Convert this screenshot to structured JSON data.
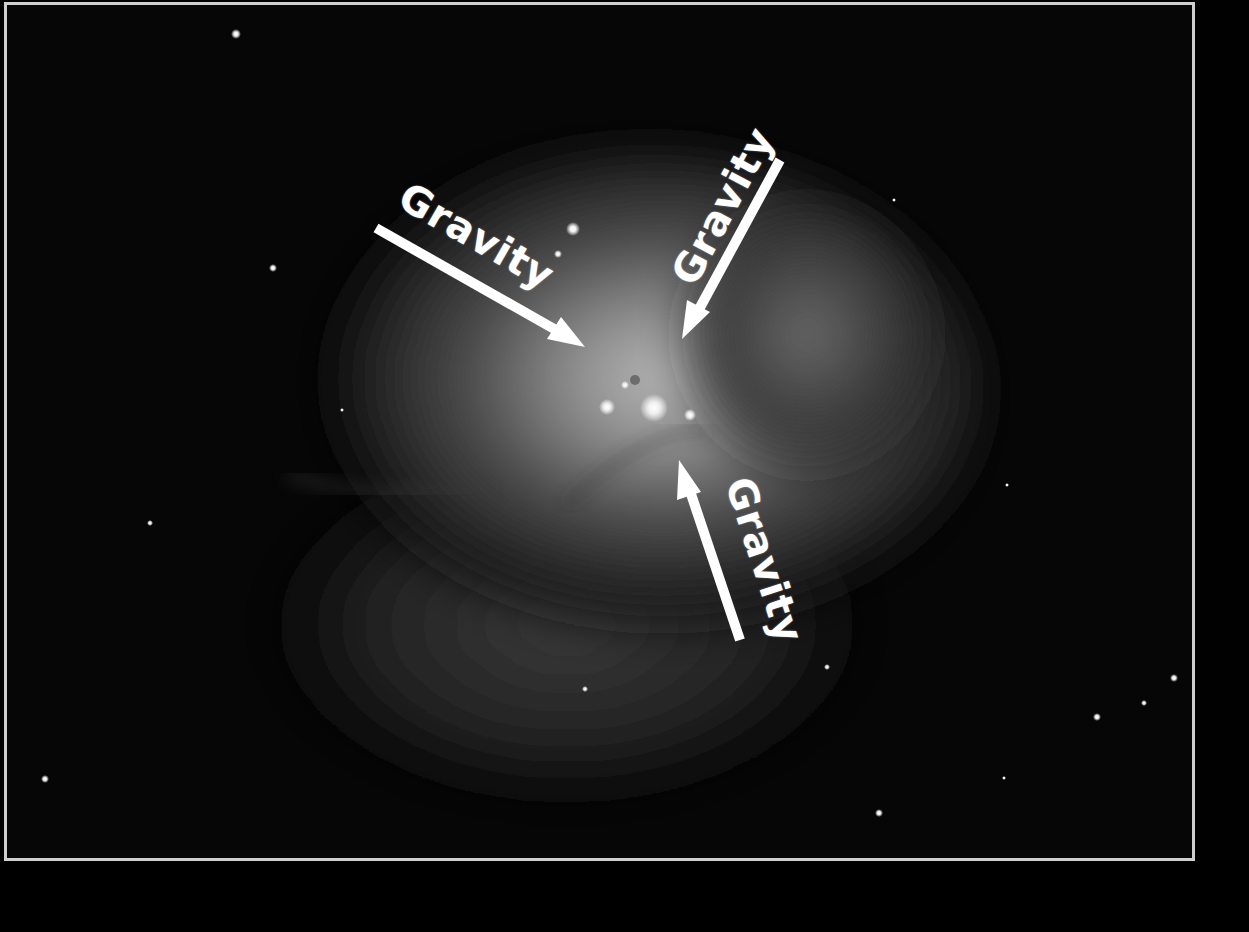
{
  "image": {
    "subject": "Star-forming nebula with central bright stars",
    "background_color": "#050505",
    "frame_color": "#cfcfcf",
    "nebula_color": "#9a9a9a"
  },
  "annotations": [
    {
      "label": "Gravity",
      "arrow_from": [
        376,
        228
      ],
      "arrow_to": [
        583,
        345
      ],
      "direction": "down-right"
    },
    {
      "label": "Gravity",
      "arrow_from": [
        780,
        160
      ],
      "arrow_to": [
        683,
        338
      ],
      "direction": "down-left"
    },
    {
      "label": "Gravity",
      "arrow_from": [
        740,
        640
      ],
      "arrow_to": [
        680,
        460
      ],
      "direction": "up-left"
    }
  ],
  "arrow_color": "#ffffff"
}
